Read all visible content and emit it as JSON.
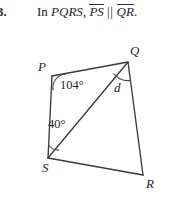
{
  "problem": {
    "number": "3.",
    "statement_prefix": "In",
    "quadrilateral": "PQRS",
    "comma": ",",
    "segment_1": "PS",
    "parallel_symbol": "||",
    "segment_2": "QR",
    "period": "."
  },
  "figure": {
    "shape_name": "quadrilateral-pqrs",
    "vertices": [
      {
        "name": "P",
        "label": "P",
        "x": 52,
        "y": 76
      },
      {
        "name": "Q",
        "label": "Q",
        "x": 128,
        "y": 62
      },
      {
        "name": "R",
        "label": "R",
        "x": 143,
        "y": 175
      },
      {
        "name": "S",
        "label": "S",
        "x": 48,
        "y": 158
      }
    ],
    "diagonal": {
      "name": "SQ",
      "from": "S",
      "to": "Q"
    },
    "angles": [
      {
        "name": "angle-at-p",
        "label": "104°",
        "vertex": "P",
        "value": "104",
        "unit": "°"
      },
      {
        "name": "angle-at-s",
        "label": "40°",
        "vertex": "S",
        "value": "40",
        "unit": "°"
      },
      {
        "name": "angle-at-q",
        "label": "d",
        "vertex": "Q",
        "value": "d",
        "unit": ""
      }
    ],
    "stroke_color": "#3a3a3a",
    "text_color": "#262626",
    "background_color": "#ffffff"
  }
}
